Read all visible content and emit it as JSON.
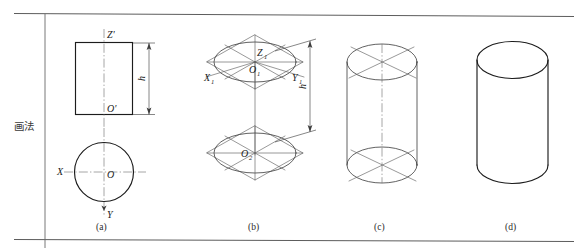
{
  "figure": {
    "row_label": "画法",
    "panels": [
      {
        "id": "a",
        "caption": "(a)",
        "dimension": "h"
      },
      {
        "id": "b",
        "caption": "(b)",
        "dimension": "h"
      },
      {
        "id": "c",
        "caption": "(c)"
      },
      {
        "id": "d",
        "caption": "(d)"
      }
    ]
  },
  "panel_a": {
    "caption": "(a)",
    "axis_z_prime": "Z'",
    "origin_front": "O'",
    "axis_x": "X",
    "axis_y": "Y",
    "origin_top": "O",
    "dimension_h": "h"
  },
  "panel_b": {
    "caption": "(b)",
    "axis_z1": "Z",
    "axis_z1_sub": "1",
    "axis_x1": "X",
    "axis_x1_sub": "1",
    "axis_y1": "Y",
    "axis_y1_sub": "1",
    "origin_upper": "O",
    "origin_upper_sub": "1",
    "origin_lower": "O",
    "origin_lower_sub": "2",
    "dimension_h": "h"
  },
  "panel_c": {
    "caption": "(c)"
  },
  "panel_d": {
    "caption": "(d)"
  },
  "colors": {
    "ink": "#1c1c1c",
    "thin_ink": "#5a5a5a",
    "frame": "#4a4a4a",
    "paper": "#ffffff"
  }
}
